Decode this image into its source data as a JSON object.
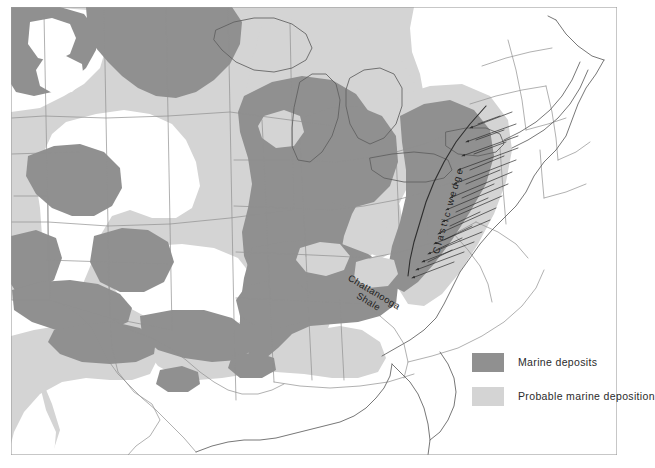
{
  "figure": {
    "kind": "paleogeographic-map",
    "region": "Eastern and central United States",
    "background_color": "#ffffff",
    "frame_color": "#9a9a9a"
  },
  "colors": {
    "marine_deposits": "#909090",
    "probable_marine_deposition": "#d4d4d4",
    "land_blank": "#ffffff",
    "state_outline": "#8b8b8b",
    "coast_outline": "#6e6e6e",
    "hachure": "#3a3a3a",
    "label_text": "#1d1d1d"
  },
  "legend": {
    "name": "map-legend",
    "items": [
      {
        "label": "Marine  deposits",
        "swatch_color": "#909090",
        "swatch_name": "marine-deposits-swatch"
      },
      {
        "label": "Probable marine deposition",
        "swatch_color": "#d4d4d4",
        "swatch_name": "probable-marine-deposition-swatch"
      }
    ]
  },
  "map_labels": {
    "chattanooga_line1": "Chattanooga",
    "chattanooga_line2": "Shale",
    "clastic_wedge": "Clastic wedge"
  }
}
